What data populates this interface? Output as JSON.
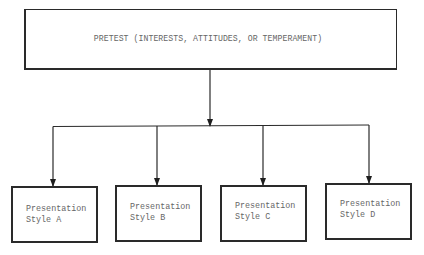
{
  "diagram": {
    "type": "flowchart-tree",
    "root": {
      "label": "PRETEST (INTERESTS, ATTITUDES, OR TEMPERAMENT)"
    },
    "children": [
      {
        "line1": "Presentation",
        "line2": "Style A"
      },
      {
        "line1": "Presentation",
        "line2": "Style B"
      },
      {
        "line1": "Presentation",
        "line2": "Style C"
      },
      {
        "line1": "Presentation",
        "line2": "Style D"
      }
    ],
    "edges": [
      {
        "from": "root",
        "to": "branch-bar"
      },
      {
        "from": "branch-bar",
        "to": "Style A"
      },
      {
        "from": "branch-bar",
        "to": "Style B"
      },
      {
        "from": "branch-bar",
        "to": "Style C"
      },
      {
        "from": "branch-bar",
        "to": "Style D"
      }
    ],
    "colors": {
      "line": "#2a2a2a",
      "text": "#666666",
      "background": "#ffffff"
    }
  }
}
